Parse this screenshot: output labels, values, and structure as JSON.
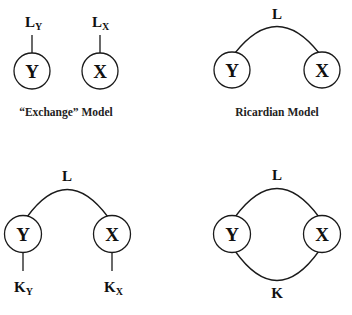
{
  "colors": {
    "stroke": "#1a1a1a",
    "text": "#111111",
    "background": "#ffffff"
  },
  "panels": {
    "exchange": {
      "caption": "“Exchange” Model",
      "nodes": {
        "y": "Y",
        "x": "X"
      },
      "factors": {
        "ly_main": "L",
        "ly_sub": "Y",
        "lx_main": "L",
        "lx_sub": "X"
      }
    },
    "ricardian": {
      "caption": "Ricardian Model",
      "nodes": {
        "y": "Y",
        "x": "X"
      },
      "factors": {
        "l": "L"
      }
    },
    "specific_factors": {
      "caption": "",
      "nodes": {
        "y": "Y",
        "x": "X"
      },
      "factors": {
        "l": "L",
        "ky_main": "K",
        "ky_sub": "Y",
        "kx_main": "K",
        "kx_sub": "X"
      }
    },
    "heckscher_ohlin": {
      "caption": "",
      "nodes": {
        "y": "Y",
        "x": "X"
      },
      "factors": {
        "l": "L",
        "k": "K"
      }
    }
  }
}
